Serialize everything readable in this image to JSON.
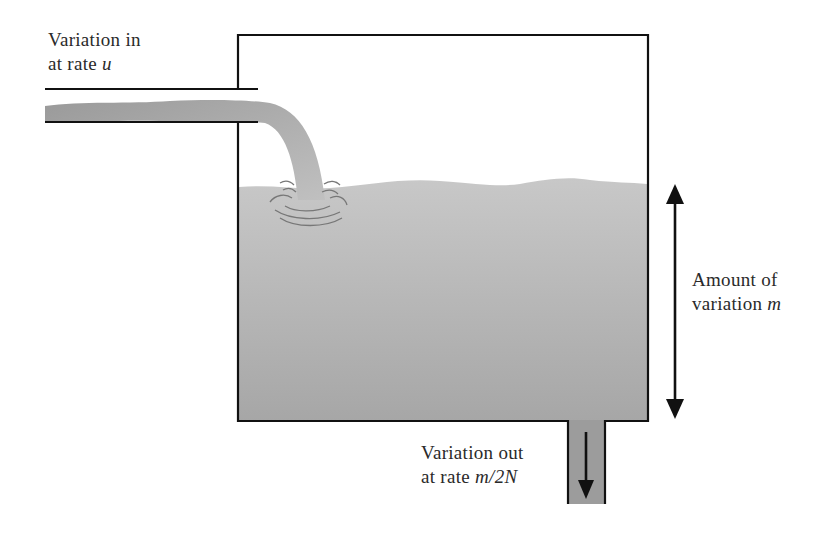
{
  "labels": {
    "inflow_line1": "Variation in",
    "inflow_line2_prefix": "at rate ",
    "inflow_var": "u",
    "amount_line1": "Amount of",
    "amount_line2_prefix": "variation ",
    "amount_var": "m",
    "outflow_line1": "Variation out",
    "outflow_line2_prefix": "at rate ",
    "outflow_var": "m/2N"
  },
  "colors": {
    "line": "#111111",
    "water_top": "#c4c4c4",
    "water_bottom": "#9a9a9a",
    "text": "#2a2a2a"
  }
}
